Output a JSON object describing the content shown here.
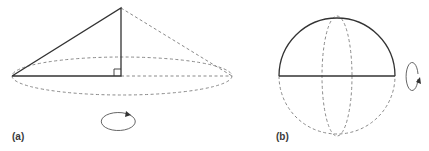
{
  "figure": {
    "panels": [
      {
        "id": "a",
        "label": "(a)",
        "description": "Right triangle rotated about its vertical leg forming a cone",
        "elements": [
          "right-triangle",
          "right-angle-marker",
          "dashed-base-ellipse",
          "dashed-cone-outline",
          "rotation-arrow-horizontal"
        ]
      },
      {
        "id": "b",
        "label": "(b)",
        "description": "Semicircle rotated about its diameter forming a sphere",
        "elements": [
          "solid-upper-semicircle",
          "solid-diameter",
          "dashed-lower-semicircle",
          "dashed-vertical-ellipse",
          "rotation-arrow-vertical"
        ]
      }
    ]
  },
  "colors": {
    "solid_stroke": "#333333",
    "dashed_stroke": "#8a8a8a",
    "label_text": "#3a3a3a",
    "background": "#ffffff"
  }
}
